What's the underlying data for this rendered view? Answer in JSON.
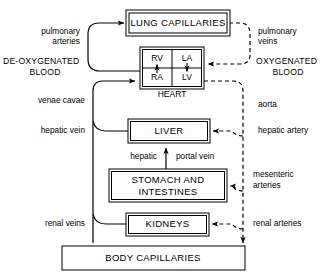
{
  "diagram": {
    "colors": {
      "line": "#000000",
      "background": "#ffffff",
      "box_fill": "#ffffff"
    },
    "boxes": {
      "lung_capillaries": {
        "label": "LUNG CAPILLARIES",
        "border": "double"
      },
      "heart": {
        "label": "HEART",
        "border": "double",
        "chambers": [
          {
            "key": "rv",
            "label": "RV"
          },
          {
            "key": "la",
            "label": "LA"
          },
          {
            "key": "ra",
            "label": "RA"
          },
          {
            "key": "lv",
            "label": "LV"
          }
        ]
      },
      "liver": {
        "label": "LIVER",
        "border": "double"
      },
      "stomach_intestines": {
        "label_line1": "STOMACH AND",
        "label_line2": "INTESTINES",
        "border": "double"
      },
      "kidneys": {
        "label": "KIDNEYS",
        "border": "double"
      },
      "body_capillaries": {
        "label": "BODY CAPILLARIES",
        "border": "single"
      }
    },
    "captions": {
      "deoxygenated_line1": "DE-OXYGENATED",
      "deoxygenated_line2": "BLOOD",
      "oxygenated_line1": "OXYGENATED",
      "oxygenated_line2": "BLOOD"
    },
    "vessels": {
      "pulmonary_arteries_line1": "pulmonary",
      "pulmonary_arteries_line2": "arteries",
      "pulmonary_veins_line1": "pulmonary",
      "pulmonary_veins_line2": "veins",
      "venae_cavae": "venae cavae",
      "hepatic_vein": "hepatic vein",
      "aorta": "aorta",
      "hepatic_artery": "hepatic artery",
      "hepatic_portal_left": "hepatic",
      "hepatic_portal_right": "portal vein",
      "mesenteric_arteries_line1": "mesenteric",
      "mesenteric_arteries_line2": "arteries",
      "renal_veins": "renal veins",
      "renal_arteries": "renal arteries"
    }
  }
}
